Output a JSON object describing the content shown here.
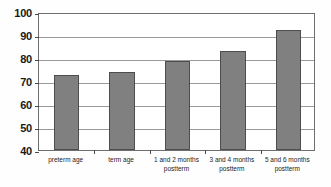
{
  "chart_data": {
    "type": "bar",
    "title": "",
    "subtitle": "",
    "xlabel": "",
    "ylabel": "",
    "ylim": [
      40,
      100
    ],
    "ytick_step": 10,
    "yticks": [
      100,
      90,
      80,
      70,
      60,
      50,
      40
    ],
    "ytick_labels": [
      "100",
      "90",
      "80",
      "70",
      "60",
      "50",
      "40"
    ],
    "grid": true,
    "legend": false,
    "legend_position": "none",
    "categories": [
      "preterm age",
      "term age",
      "1 and 2 months postterm",
      "3 and 4 months postterm",
      "5 and 6 months postterm"
    ],
    "category_lines": [
      [
        "preterm age",
        ""
      ],
      [
        "term age",
        ""
      ],
      [
        "1 and 2 months",
        "postterm"
      ],
      [
        "3 and 4 months",
        "postterm"
      ],
      [
        "5 and 6 months",
        "postterm"
      ]
    ],
    "values": [
      72.8,
      74.0,
      78.5,
      83.0,
      92.0
    ],
    "series": [
      {
        "name": "",
        "values": [
          72.8,
          74.0,
          78.5,
          83.0,
          92.0
        ]
      }
    ]
  },
  "style": {
    "bar_fill": "#808080",
    "bar_border": "#4d4d4d",
    "gridline_color": "#9a9a9a",
    "frame_color": "#6e6e6e",
    "plot_background": "#ffffff",
    "text_color": "#1a1a1a"
  }
}
